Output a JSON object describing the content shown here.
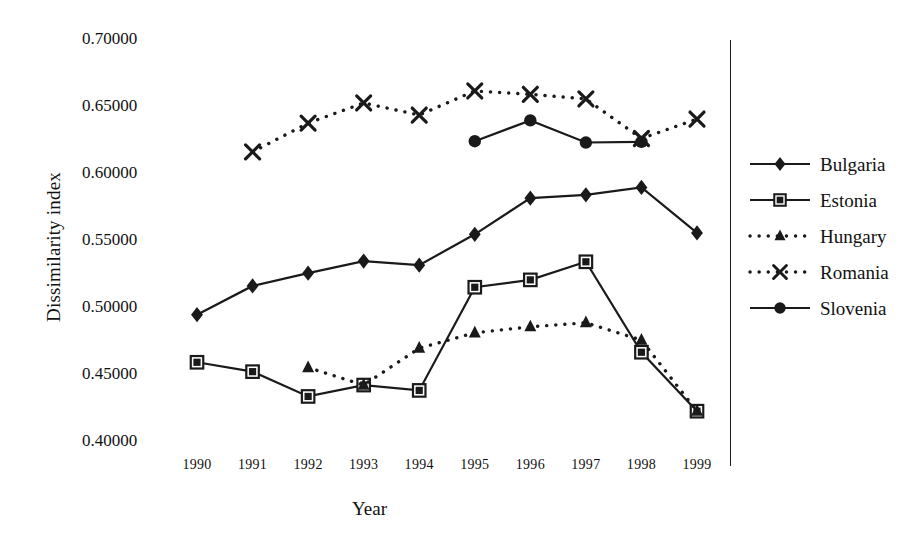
{
  "chart_data": {
    "type": "line",
    "title": "",
    "xlabel": "Year",
    "ylabel": "Dissimilarity index",
    "x": [
      1990,
      1991,
      1992,
      1993,
      1994,
      1995,
      1996,
      1997,
      1998,
      1999
    ],
    "xtick_labels": [
      "1990",
      "1991",
      "1992",
      "1993",
      "1994",
      "1995",
      "1996",
      "1997",
      "1998",
      "1999"
    ],
    "ytick_labels": [
      "0.70000",
      "0.65000",
      "0.60000",
      "0.55000",
      "0.50000",
      "0.45000",
      "0.40000"
    ],
    "ytick_values": [
      0.7,
      0.65,
      0.6,
      0.55,
      0.5,
      0.45,
      0.4
    ],
    "ylim": [
      0.4,
      0.7
    ],
    "xlim": [
      1990,
      1999
    ],
    "grid": false,
    "legend_position": "right",
    "series": [
      {
        "name": "Bulgaria",
        "marker": "diamond",
        "line": "solid",
        "color": "#1a1a1a",
        "x": [
          1990,
          1991,
          1992,
          1993,
          1994,
          1995,
          1996,
          1997,
          1998,
          1999
        ],
        "values": [
          0.4935,
          0.515,
          0.5245,
          0.5335,
          0.5305,
          0.5535,
          0.5805,
          0.583,
          0.5885,
          0.5545
        ]
      },
      {
        "name": "Estonia",
        "marker": "square",
        "line": "solid",
        "color": "#1a1a1a",
        "x": [
          1990,
          1991,
          1992,
          1993,
          1994,
          1995,
          1996,
          1997,
          1998,
          1999
        ],
        "values": [
          0.458,
          0.451,
          0.4325,
          0.441,
          0.437,
          0.514,
          0.5195,
          0.533,
          0.4655,
          0.4215
        ]
      },
      {
        "name": "Hungary",
        "marker": "triangle",
        "line": "dotted",
        "color": "#1a1a1a",
        "x": [
          1992,
          1993,
          1994,
          1995,
          1996,
          1997,
          1998,
          1999
        ],
        "values": [
          0.454,
          0.441,
          0.4685,
          0.48,
          0.4845,
          0.4875,
          0.4745,
          0.4215
        ]
      },
      {
        "name": "Romania",
        "marker": "cross",
        "line": "dotted",
        "color": "#1a1a1a",
        "x": [
          1991,
          1992,
          1993,
          1994,
          1995,
          1996,
          1997,
          1998,
          1999
        ],
        "values": [
          0.615,
          0.6365,
          0.6515,
          0.6425,
          0.6605,
          0.658,
          0.6545,
          0.625,
          0.6395
        ]
      },
      {
        "name": "Slovenia",
        "marker": "circle",
        "line": "solid",
        "color": "#1a1a1a",
        "x": [
          1995,
          1996,
          1997,
          1998
        ],
        "values": [
          0.623,
          0.6385,
          0.622,
          0.6225
        ]
      }
    ]
  }
}
